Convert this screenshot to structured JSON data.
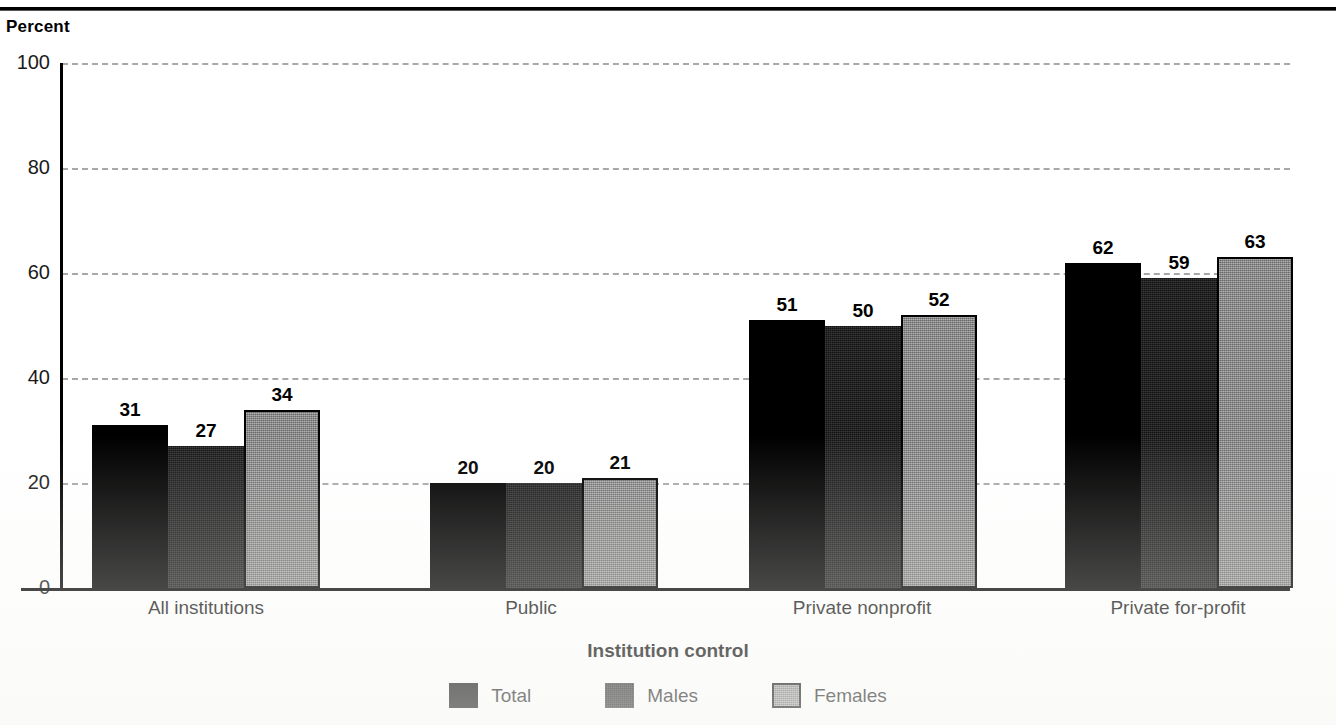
{
  "figure": {
    "title_partial": "",
    "y_axis_title": "Percent",
    "x_axis_title": "Institution control"
  },
  "legend": {
    "items": [
      {
        "label": "Total",
        "swatch": "black-swatch"
      },
      {
        "label": "Males",
        "swatch": "dark-textured-swatch"
      },
      {
        "label": "Females",
        "swatch": "gray-textured-swatch"
      }
    ]
  },
  "chart_data": {
    "type": "bar",
    "title": "",
    "xlabel": "Institution control",
    "ylabel": "Percent",
    "ylim": [
      0,
      100
    ],
    "yticks": [
      0,
      20,
      40,
      60,
      80,
      100
    ],
    "grid": true,
    "legend_position": "bottom-center",
    "categories": [
      "All institutions",
      "Public",
      "Private nonprofit",
      "Private for-profit"
    ],
    "series": [
      {
        "name": "Total",
        "color": "#000000",
        "values": [
          31,
          20,
          51,
          62
        ]
      },
      {
        "name": "Males",
        "color": "#121212",
        "values": [
          27,
          20,
          50,
          59
        ]
      },
      {
        "name": "Females",
        "color": "#848484",
        "values": [
          34,
          21,
          52,
          63
        ]
      }
    ],
    "data_labels": [
      [
        "31",
        "27",
        "34"
      ],
      [
        "20",
        "20",
        "21"
      ],
      [
        "51",
        "50",
        "52"
      ],
      [
        "62",
        "59",
        "63"
      ]
    ]
  },
  "ytick_labels": [
    "100",
    "80",
    "60",
    "40",
    "20",
    "0"
  ]
}
